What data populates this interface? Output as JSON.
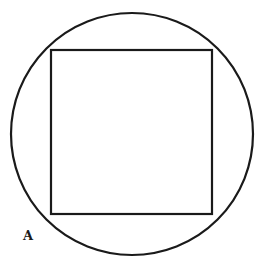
{
  "figure": {
    "label": "A",
    "shapes": {
      "circle": {
        "cx": 132,
        "cy": 134,
        "r": 121
      },
      "square": {
        "x": 51,
        "y": 50,
        "width": 161,
        "height": 164
      }
    },
    "stroke_color": "#1a1a1a",
    "background": "#ffffff"
  }
}
